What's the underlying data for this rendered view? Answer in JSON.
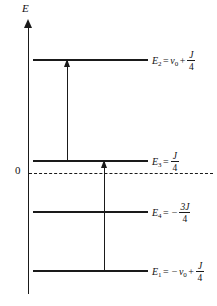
{
  "figure": {
    "type": "energy-level-diagram",
    "background_color": "#ffffff",
    "ink_color": "#1a1a1a"
  },
  "axis": {
    "label": "E",
    "name": "energy-axis",
    "direction": "up",
    "zero_label": "0"
  },
  "levels": [
    {
      "id": "E2",
      "symbol": "E",
      "subscript": "2",
      "equals": "=",
      "expression": "ν₀ + J/4",
      "term1": "ν",
      "term1_sub": "0",
      "operator": "+",
      "frac_numerator": "J",
      "frac_denominator": "4",
      "leading_sign": "",
      "y": 59
    },
    {
      "id": "E3",
      "symbol": "E",
      "subscript": "3",
      "equals": "=",
      "expression": "J/4",
      "term1": "",
      "term1_sub": "",
      "operator": "",
      "frac_numerator": "J",
      "frac_denominator": "4",
      "leading_sign": "",
      "y": 160
    },
    {
      "id": "E4",
      "symbol": "E",
      "subscript": "4",
      "equals": "=",
      "expression": "-3J/4",
      "term1": "",
      "term1_sub": "",
      "operator": "",
      "frac_numerator": "3J",
      "frac_denominator": "4",
      "leading_sign": "−",
      "y": 211
    },
    {
      "id": "E1",
      "symbol": "E",
      "subscript": "1",
      "equals": "=",
      "expression": "-ν₀ + J/4",
      "term1": "ν",
      "term1_sub": "0",
      "operator": "+",
      "frac_numerator": "J",
      "frac_denominator": "4",
      "leading_sign": "−",
      "y": 270
    }
  ],
  "transitions": [
    {
      "name": "transition-E3-to-E2",
      "from": "E3",
      "to": "E2",
      "x": 67,
      "top": 59,
      "bottom": 160
    },
    {
      "name": "transition-E1-to-E3",
      "from": "E1",
      "to": "E3",
      "x": 104,
      "top": 160,
      "bottom": 270
    }
  ]
}
